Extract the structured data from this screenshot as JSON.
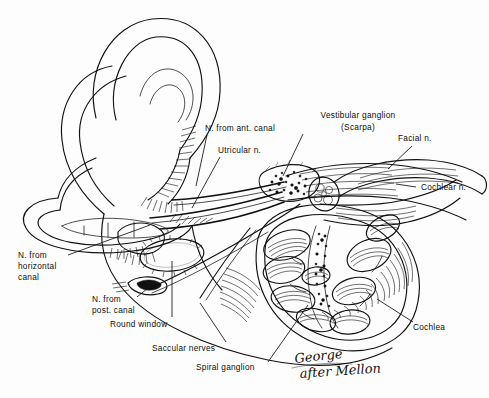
{
  "figure": {
    "background_color": "#fdfdfd",
    "ink_color": "#111111",
    "style": "hand-drawn anatomical line illustration, black ink on white"
  },
  "signature": {
    "line1": "George",
    "line2": "after Mellon",
    "full": "George after Mellon"
  },
  "labels": [
    {
      "id": "n-from-ant-canal",
      "name": "nerve-from-anterior-canal",
      "lines": [
        "N. from ant. canal"
      ],
      "text_x": 205,
      "text_y": 131,
      "anchor": "start",
      "leader": [
        [
          207,
          135
        ],
        [
          196,
          186
        ]
      ]
    },
    {
      "id": "utricular-n",
      "name": "utricular-nerve",
      "lines": [
        "Utricular n."
      ],
      "text_x": 218,
      "text_y": 153,
      "anchor": "start",
      "leader": [
        [
          220,
          157
        ],
        [
          192,
          208
        ]
      ]
    },
    {
      "id": "vestibular-ganglion",
      "name": "vestibular-ganglion-scarpa",
      "lines": [
        "Vestibular ganglion",
        "(Scarpa)"
      ],
      "text_x": 358,
      "text_y": 118,
      "anchor": "middle",
      "leader": [
        [
          303,
          134
        ],
        [
          283,
          176
        ]
      ]
    },
    {
      "id": "facial-n",
      "name": "facial-nerve",
      "lines": [
        "Facial n."
      ],
      "text_x": 398,
      "text_y": 141,
      "anchor": "start",
      "leader": [
        [
          412,
          146
        ],
        [
          388,
          169
        ]
      ]
    },
    {
      "id": "cochlear-n",
      "name": "cochlear-nerve",
      "lines": [
        "Cochlear n."
      ],
      "text_x": 417,
      "text_y": 190,
      "anchor": "start",
      "leader": [
        [
          416,
          187
        ],
        [
          396,
          184
        ]
      ]
    },
    {
      "id": "cochlea",
      "name": "cochlea",
      "lines": [
        "Cochlea"
      ],
      "text_x": 413,
      "text_y": 327,
      "anchor": "start",
      "leader": [
        [
          413,
          322
        ],
        [
          377,
          299
        ]
      ]
    },
    {
      "id": "n-from-horizontal-canal",
      "name": "nerve-from-horizontal-canal",
      "lines": [
        "N. from",
        "horizontal",
        "canal"
      ],
      "text_x": 18,
      "text_y": 258,
      "anchor": "start",
      "leader": [
        [
          68,
          255
        ],
        [
          150,
          225
        ]
      ]
    },
    {
      "id": "n-from-post-canal",
      "name": "nerve-from-posterior-canal",
      "lines": [
        "N. from",
        "post. canal"
      ],
      "text_x": 92,
      "text_y": 302,
      "anchor": "start",
      "leader": [
        [
          137,
          297
        ],
        [
          148,
          288
        ]
      ]
    },
    {
      "id": "round-window",
      "name": "round-window",
      "lines": [
        "Round window"
      ],
      "text_x": 110,
      "text_y": 325,
      "anchor": "start",
      "leader": [
        [
          172,
          317
        ],
        [
          172,
          261
        ]
      ]
    },
    {
      "id": "saccular-nerves",
      "name": "saccular-nerves",
      "lines": [
        "Saccular nerves"
      ],
      "text_x": 152,
      "text_y": 350,
      "anchor": "start",
      "leader": [
        [
          226,
          342
        ],
        [
          200,
          303
        ]
      ]
    },
    {
      "id": "spiral-ganglion",
      "name": "spiral-ganglion",
      "lines": [
        "Spiral ganglion"
      ],
      "text_x": 196,
      "text_y": 369,
      "anchor": "start",
      "leader": [
        [
          268,
          362
        ],
        [
          308,
          305
        ]
      ]
    }
  ],
  "structures": [
    {
      "name": "anterior-semicircular-canal",
      "description": "large upper loop"
    },
    {
      "name": "posterior-semicircular-canal",
      "description": "left rear loop"
    },
    {
      "name": "horizontal-semicircular-canal",
      "description": "lower flattened ring"
    },
    {
      "name": "utricle",
      "description": "central vestibule chamber"
    },
    {
      "name": "saccule",
      "description": "oval chamber below utricle"
    },
    {
      "name": "round-window",
      "description": "small oval opening"
    },
    {
      "name": "vestibular-ganglion",
      "description": "stippled swelling on nerve trunk"
    },
    {
      "name": "facial-nerve",
      "description": "upper thick nerve trunk, cut end"
    },
    {
      "name": "cochlear-nerve",
      "description": "lower nerve trunk with fascicles"
    },
    {
      "name": "cochlea",
      "description": "spiral, cut to show scalae turns"
    },
    {
      "name": "spiral-ganglion",
      "description": "stippled band in cochlear modiolus"
    }
  ]
}
